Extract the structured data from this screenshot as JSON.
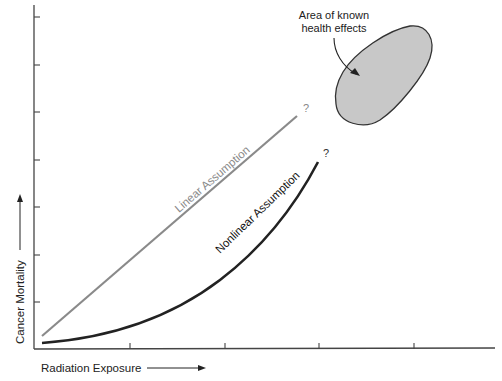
{
  "chart_data": {
    "type": "line",
    "title": "",
    "xlabel": "Radiation Exposure",
    "ylabel": "Cancer Mortality",
    "xlim": [
      0,
      100
    ],
    "ylim": [
      0,
      100
    ],
    "x_ticks": 4,
    "y_ticks": 7,
    "grid": false,
    "series": [
      {
        "name": "Linear Assumption",
        "color": "#8a8a8a",
        "x": [
          2,
          58
        ],
        "y": [
          4,
          70
        ],
        "end_marker": "?"
      },
      {
        "name": "Nonlinear Assumption",
        "color": "#222222",
        "x": [
          2,
          10,
          20,
          30,
          40,
          50,
          58,
          62
        ],
        "y": [
          2,
          4,
          9,
          16,
          26,
          39,
          49,
          56
        ],
        "end_marker": "?"
      }
    ],
    "region": {
      "label": "Area of known health effects",
      "fill": "#c8c8c8",
      "stroke": "#333333",
      "center": [
        82,
        84
      ]
    }
  }
}
